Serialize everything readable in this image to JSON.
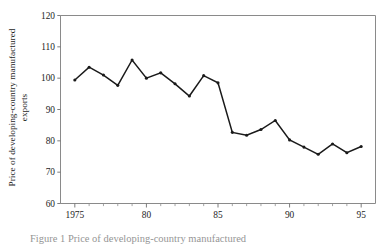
{
  "figure": {
    "caption_partial": "Figure 1 Price of developing-country manufactured"
  },
  "chart_data": {
    "type": "line",
    "title": "",
    "xlabel": "",
    "ylabel": "Price of developing-country manufactured exports",
    "ylabel_line1": "Price of developing-country manufactured",
    "ylabel_line2": "exports",
    "x": [
      1975,
      1976,
      1977,
      1978,
      1979,
      1980,
      1981,
      1982,
      1983,
      1984,
      1985,
      1986,
      1987,
      1988,
      1989,
      1990,
      1991,
      1992,
      1993,
      1994,
      1995
    ],
    "values": [
      99.4,
      103.5,
      101.0,
      97.7,
      105.8,
      100.0,
      101.7,
      98.2,
      94.3,
      100.8,
      98.5,
      82.7,
      81.8,
      83.6,
      86.5,
      80.3,
      78.0,
      75.7,
      79.0,
      76.2,
      78.2
    ],
    "xlim": [
      1974,
      1996
    ],
    "ylim": [
      60,
      120
    ],
    "yticks": [
      60,
      70,
      80,
      90,
      100,
      110,
      120
    ],
    "ytick_labels": [
      "60",
      "70",
      "80",
      "90",
      "100",
      "110",
      "120"
    ],
    "xticks": [
      1975,
      1980,
      1985,
      1990,
      1995
    ],
    "xtick_labels": [
      "1975",
      "80",
      "85",
      "90",
      "95"
    ],
    "xtick_minor_step": 1,
    "grid": false,
    "legend": null,
    "marker": "filled-circle",
    "line_color": "#1a1a1a",
    "axis_color": "#8a8a8a",
    "background": "#ffffff"
  }
}
